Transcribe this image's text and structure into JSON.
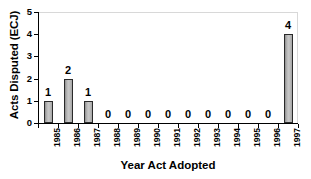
{
  "chart_data": {
    "type": "bar",
    "title": "",
    "xlabel": "Year Act Adopted",
    "ylabel": "Acts Disputed (ECJ)",
    "categories": [
      "1985",
      "1986",
      "1987",
      "1988",
      "1989",
      "1990",
      "1991",
      "1992",
      "1993",
      "1994",
      "1995",
      "1996",
      "1997"
    ],
    "values": [
      1,
      2,
      1,
      0,
      0,
      0,
      0,
      0,
      0,
      0,
      0,
      0,
      4
    ],
    "data_labels": [
      "1",
      "2",
      "1",
      "0",
      "0",
      "0",
      "0",
      "0",
      "0",
      "0",
      "0",
      "0",
      "4"
    ],
    "ylim": [
      0,
      5
    ],
    "yticks": [
      0,
      1,
      2,
      3,
      4,
      5
    ],
    "ytick_labels": [
      "0",
      "1",
      "2",
      "3",
      "4",
      "5"
    ],
    "grid": false,
    "legend": "none",
    "bar_color": "#b4b4b4",
    "bar_edge_color": "#2a2a2a",
    "background": "#ffffff",
    "axis_color": "#000000"
  }
}
